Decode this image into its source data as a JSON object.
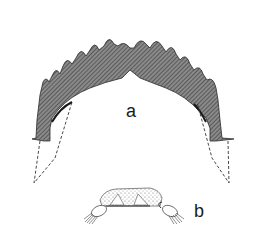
{
  "figure": {
    "panels": [
      {
        "id": "a",
        "label": "a",
        "description": "toothed arch (mentum) with dashed lateral outlines"
      },
      {
        "id": "b",
        "label": "b",
        "description": "small stippled structure with two lateral bristled appendages"
      }
    ],
    "colors": {
      "ink": "#1a1a1a",
      "hatch_fill": "#6f6f6f",
      "stipple": "#9a9a9a",
      "background": "#ffffff"
    }
  }
}
